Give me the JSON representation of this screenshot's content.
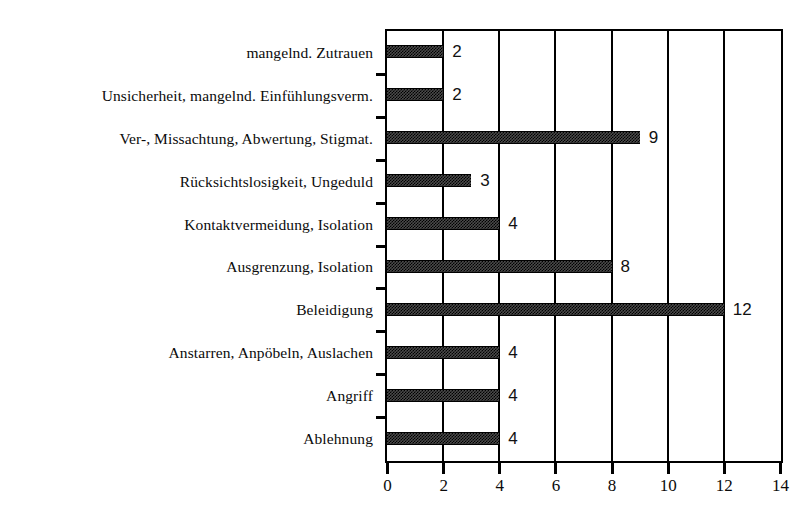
{
  "chart_data": {
    "type": "bar",
    "orientation": "horizontal",
    "title": "",
    "subtitle": "",
    "xlabel": "",
    "ylabel": "",
    "xlim": [
      0,
      14
    ],
    "ylim": null,
    "grid": true,
    "grid_axis": "x",
    "legend": false,
    "legend_position": "none",
    "xticks": [
      0,
      2,
      4,
      6,
      8,
      10,
      12,
      14
    ],
    "xtick_labels": [
      "0",
      "2",
      "4",
      "6",
      "8",
      "10",
      "12",
      "14"
    ],
    "bar_color": "#4a4a4a",
    "bar_edge_color": "#000000",
    "axis_color": "#000000",
    "background_color": "#ffffff",
    "categories": [
      "mangelnd. Zutrauen",
      "Unsicherheit, mangelnd. Einfühlungsverm.",
      "Ver-, Missachtung, Abwertung, Stigmat.",
      "Rücksichtslosigkeit, Ungeduld",
      "Kontaktvermeidung, Isolation",
      "Ausgrenzung, Isolation",
      "Beleidigung",
      "Anstarren, Anpöbeln, Auslachen",
      "Angriff",
      "Ablehnung"
    ],
    "values": [
      2,
      2,
      9,
      3,
      4,
      8,
      12,
      4,
      4,
      4
    ],
    "value_labels": [
      "2",
      "2",
      "9",
      "3",
      "4",
      "8",
      "12",
      "4",
      "4",
      "4"
    ]
  }
}
